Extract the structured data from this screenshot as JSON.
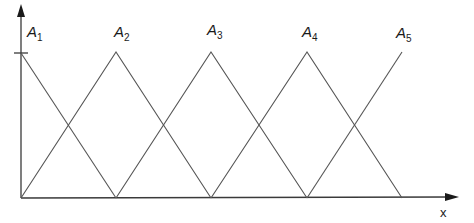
{
  "diagram": {
    "type": "fuzzy-triangular-membership-functions",
    "axes": {
      "x_label": "x",
      "y_tick": "1"
    },
    "sets": [
      {
        "name": "A",
        "sub": "1",
        "shape": "right-half-triangle",
        "peak_x": 21,
        "left_x": 21,
        "right_x": 116,
        "label_x": 27,
        "label_y": 37
      },
      {
        "name": "A",
        "sub": "2",
        "shape": "triangle",
        "peak_x": 116,
        "left_x": 21,
        "right_x": 211,
        "label_x": 114,
        "label_y": 37
      },
      {
        "name": "A",
        "sub": "3",
        "shape": "triangle",
        "peak_x": 211,
        "left_x": 116,
        "right_x": 307,
        "label_x": 207,
        "label_y": 35
      },
      {
        "name": "A",
        "sub": "4",
        "shape": "triangle",
        "peak_x": 307,
        "left_x": 211,
        "right_x": 402,
        "label_x": 302,
        "label_y": 37
      },
      {
        "name": "A",
        "sub": "5",
        "shape": "left-half-triangle",
        "peak_x": 402,
        "left_x": 307,
        "right_x": 402,
        "label_x": 396,
        "label_y": 38
      }
    ],
    "colors": {
      "lines": "#555555",
      "axes": "#3a3a3a",
      "text": "#1a1a1a"
    }
  }
}
